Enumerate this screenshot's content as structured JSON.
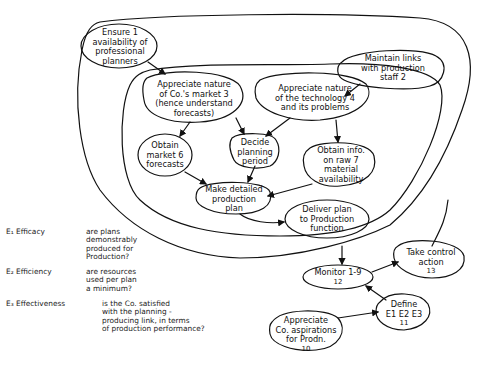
{
  "diagram": {
    "type": "activity-system-diagram",
    "nodes": [
      {
        "id": 1,
        "lines": [
          "Ensure 1",
          "availability of",
          "professional",
          "planners"
        ]
      },
      {
        "id": 2,
        "lines": [
          "Maintain links",
          "with production",
          "staff 2"
        ]
      },
      {
        "id": 3,
        "lines": [
          "Appreciate nature",
          "of Co.'s market 3",
          "(hence understand",
          "forecasts)"
        ]
      },
      {
        "id": 4,
        "lines": [
          "Appreciate nature",
          "of the technology 4",
          "and its problems"
        ]
      },
      {
        "id": 5,
        "lines": [
          "Decide",
          "planning",
          "period"
        ]
      },
      {
        "id": 6,
        "lines": [
          "Obtain",
          "market 6",
          "forecasts"
        ]
      },
      {
        "id": 7,
        "lines": [
          "Obtain info.",
          "on raw   7",
          "material",
          "availability"
        ]
      },
      {
        "id": 8,
        "lines": [
          "Make detailed",
          "production",
          "plan"
        ]
      },
      {
        "id": 9,
        "lines": [
          "Deliver plan",
          "to Production",
          "function"
        ],
        "num": "9"
      },
      {
        "id": 10,
        "lines": [
          "Appreciate",
          "Co. aspirations",
          "for Prodn."
        ],
        "num": "10"
      },
      {
        "id": 11,
        "lines": [
          "Define",
          "E1 E2 E3"
        ],
        "num": "11"
      },
      {
        "id": 12,
        "lines": [
          "Monitor 1-9"
        ],
        "num": "12"
      },
      {
        "id": 13,
        "lines": [
          "Take control",
          "action"
        ],
        "num": "13"
      }
    ],
    "edges": [
      [
        "1",
        "3"
      ],
      [
        "2",
        "4"
      ],
      [
        "3",
        "5"
      ],
      [
        "4",
        "5"
      ],
      [
        "3",
        "6"
      ],
      [
        "4",
        "7"
      ],
      [
        "6",
        "8"
      ],
      [
        "5",
        "8"
      ],
      [
        "7",
        "8"
      ],
      [
        "8",
        "9"
      ],
      [
        "system",
        "12"
      ],
      [
        "12",
        "13"
      ],
      [
        "13",
        "system"
      ],
      [
        "10",
        "11"
      ],
      [
        "11",
        "12"
      ]
    ],
    "criteria": [
      {
        "code": "E₁ Efficacy",
        "question": [
          "are plans",
          "demonstrably",
          "produced for",
          "Production?"
        ]
      },
      {
        "code": "E₂ Efficiency",
        "question": [
          "are resources",
          "used per plan",
          "a minimum?"
        ]
      },
      {
        "code": "E₃ Effectiveness",
        "question": [
          "is the Co. satisfied",
          "with the planning -",
          "producing link, in terms",
          "of production performance?"
        ]
      }
    ],
    "colors": {
      "ink": "#111111",
      "paper": "#ffffff"
    }
  }
}
